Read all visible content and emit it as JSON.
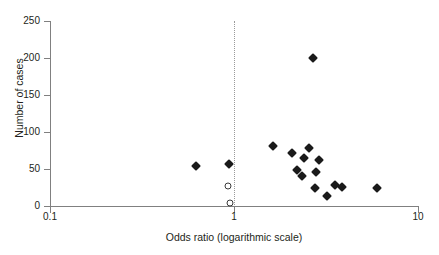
{
  "chart_data": {
    "type": "scatter",
    "title": "",
    "xlabel": "Odds ratio (logarithmic scale)",
    "ylabel": "Number of cases",
    "xscale": "log",
    "xlim": [
      0.1,
      10
    ],
    "ylim": [
      0,
      250
    ],
    "xticks": [
      0.1,
      1,
      10
    ],
    "xtick_labels": [
      "0.1",
      "1",
      "10"
    ],
    "yticks": [
      0,
      50,
      100,
      150,
      200,
      250
    ],
    "ytick_labels": [
      "0",
      "50",
      "100",
      "150",
      "200",
      "250"
    ],
    "grid": false,
    "legend": "none",
    "reference_line": {
      "x": 1.0,
      "style": "dotted",
      "color": "#9a9a9a"
    },
    "series": [
      {
        "name": "filled",
        "marker": "filled-diamond",
        "color": "#1a1a1a",
        "points": [
          {
            "x": 0.62,
            "y": 54
          },
          {
            "x": 0.94,
            "y": 57
          },
          {
            "x": 1.63,
            "y": 81
          },
          {
            "x": 2.06,
            "y": 72
          },
          {
            "x": 2.55,
            "y": 78
          },
          {
            "x": 2.4,
            "y": 65
          },
          {
            "x": 2.2,
            "y": 49
          },
          {
            "x": 2.35,
            "y": 41
          },
          {
            "x": 2.88,
            "y": 62
          },
          {
            "x": 2.79,
            "y": 46
          },
          {
            "x": 2.75,
            "y": 25
          },
          {
            "x": 3.56,
            "y": 29
          },
          {
            "x": 3.88,
            "y": 26
          },
          {
            "x": 3.2,
            "y": 14
          },
          {
            "x": 2.7,
            "y": 200
          },
          {
            "x": 5.97,
            "y": 24
          }
        ]
      },
      {
        "name": "open",
        "marker": "open-circle",
        "color": "#3a3a3a",
        "points": [
          {
            "x": 0.93,
            "y": 27
          },
          {
            "x": 0.95,
            "y": 4
          }
        ]
      }
    ]
  },
  "axes": {
    "y_title": "Number of cases",
    "x_title": "Odds ratio (logarithmic scale)"
  }
}
